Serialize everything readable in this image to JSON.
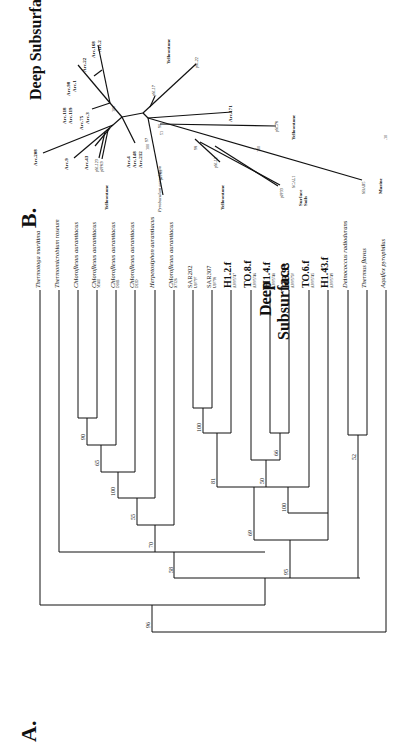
{
  "panel_b": {
    "letter": "B.",
    "title": "Deep Subsurface",
    "arc_labels": [
      "Arc.168",
      "Arc.2",
      "Arc.22",
      "Arc.98",
      "Arc.1",
      "Arc.118",
      "Arc.119",
      "Arc.75",
      "Arc.3",
      "Arc.208",
      "Arc.9",
      "Arc.43",
      "Arc.4",
      "Arc.148",
      "Arc.212",
      "Arc.171"
    ],
    "clone_labels": [
      "pSL22",
      "pSL17",
      "pSL78",
      "pSL12",
      "pJP8.1",
      "pJP8.9",
      "pSL123",
      "pJP33",
      "SCAL1",
      "SBAR5"
    ],
    "species": "Pyrobaculum aerophilum",
    "env_labels": {
      "yellowstone": "Yellowstone",
      "surface_soils": "Surface Soils",
      "marine": "Marine"
    },
    "bootstrap": [
      "100",
      "98",
      "99",
      "97",
      "51",
      "90",
      "100",
      "100",
      "98",
      "100"
    ],
    "scale": ".10"
  },
  "panel_a": {
    "letter": "A.",
    "title_line1": "Deep",
    "title_line2": "Subsurface",
    "taxa": [
      {
        "name": "Thermotoga maritima",
        "acc": ""
      },
      {
        "name": "Thermomicrobium roseum",
        "acc": ""
      },
      {
        "name": "Chloroflexus aurantiacus",
        "acc": ""
      },
      {
        "name": "Chloroflexus aurantiacus",
        "acc": "M341I"
      },
      {
        "name": "Chloroflexus aurantiacus",
        "acc": "D18B"
      },
      {
        "name": "Chloroflexus aurantiacus",
        "acc": "D22D"
      },
      {
        "name": "Herpetosiphon aurantiacus",
        "acc": ""
      },
      {
        "name": "Chloroflexus aurantiacus",
        "acc": "X7326"
      }
    ],
    "clones": [
      {
        "name": "SAR202",
        "acc": "U20797",
        "bold": false
      },
      {
        "name": "SAR307",
        "acc": "U20798",
        "bold": false
      },
      {
        "name": "H1.2.f",
        "acc": "AF005747",
        "bold": true
      },
      {
        "name": "TO.8.f",
        "acc": "AF005746",
        "bold": true
      },
      {
        "name": "H1.4.f",
        "acc": "AF005748",
        "bold": true
      },
      {
        "name": "H3.93",
        "acc": "AF005750",
        "bold": true
      },
      {
        "name": "TO.6.f",
        "acc": "AF005745",
        "bold": true
      },
      {
        "name": "H1.43.f",
        "acc": "AF005749",
        "bold": true
      }
    ],
    "outgroups": [
      "Deinococcus radiodurans",
      "Thermus flavus",
      "Aquifex pyrophilus"
    ],
    "bootstrap": {
      "b90": "90",
      "b65": "65",
      "b100a": "100",
      "b55": "55",
      "b70": "70",
      "b58": "58",
      "b96": "96",
      "b100b": "100",
      "b81": "81",
      "b50": "50",
      "b66": "66",
      "b100c": "100",
      "b69": "69",
      "b95": "95",
      "b52": "52"
    }
  }
}
